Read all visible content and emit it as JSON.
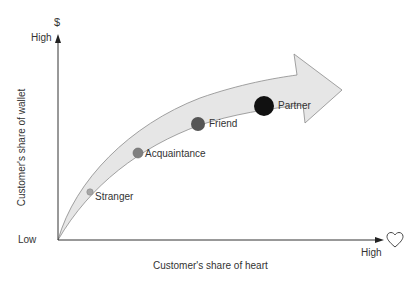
{
  "axes": {
    "y_symbol": "$",
    "y_high": "High",
    "y_label": "Customer's share of wallet",
    "x_low": "Low",
    "x_high": "High",
    "x_label": "Customer's share of heart",
    "x_symbol_icon": "heart-icon"
  },
  "points": [
    {
      "label": "Stranger",
      "color": "#a6a6a6",
      "size": "small"
    },
    {
      "label": "Acquaintance",
      "color": "#808080",
      "size": "medium"
    },
    {
      "label": "Friend",
      "color": "#555555",
      "size": "large"
    },
    {
      "label": "Partner",
      "color": "#111111",
      "size": "xlarge"
    }
  ],
  "colors": {
    "arrow_fill": "#e6e6e6",
    "arrow_stroke": "#8c8c8c",
    "axis": "#333333"
  }
}
